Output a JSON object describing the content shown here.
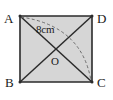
{
  "figure": {
    "name": "Square ABCD with diagonals",
    "shape_type": "square",
    "fill_color": "#d6d6d6",
    "stroke_color": "#2b2b2b",
    "dashed_stroke_color": "#6b6b6b",
    "background_color": "#ffffff",
    "vertices": [
      {
        "id": "A",
        "label": "A",
        "position": "top-left",
        "x": 20,
        "y": 16
      },
      {
        "id": "D",
        "label": "D",
        "position": "top-right",
        "x": 92,
        "y": 16
      },
      {
        "id": "C",
        "label": "C",
        "position": "bottom-right",
        "x": 92,
        "y": 82
      },
      {
        "id": "B",
        "label": "B",
        "position": "bottom-left",
        "x": 20,
        "y": 82
      }
    ],
    "center": {
      "id": "O",
      "label": "O",
      "x": 56,
      "y": 49
    },
    "diagonals": [
      {
        "from": "A",
        "to": "C",
        "style": "solid"
      },
      {
        "from": "B",
        "to": "D",
        "style": "solid"
      }
    ],
    "arc": {
      "from": "A",
      "to": "C",
      "style": "dashed",
      "through": "interior"
    },
    "measure": {
      "label": "8 cm",
      "display": "8cm",
      "value": 8,
      "unit": "cm",
      "applies_to": "diagonal AC"
    }
  }
}
